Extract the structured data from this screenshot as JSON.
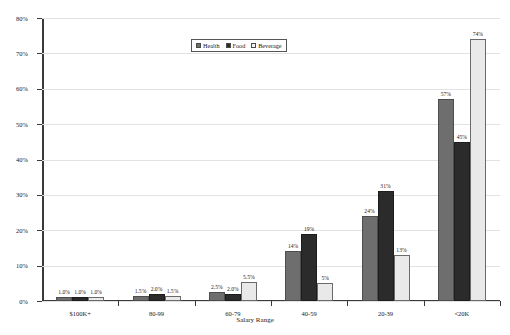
{
  "chart_data": {
    "type": "bar",
    "title": "",
    "xlabel": "Salary Range",
    "ylabel": "",
    "categories": [
      "$100K+",
      "80-99",
      "60-79",
      "40-59",
      "20-39",
      "<20K"
    ],
    "ylim": [
      0,
      80
    ],
    "ytick_values": [
      0,
      10,
      20,
      30,
      40,
      50,
      60,
      70,
      80
    ],
    "ytick_labels": [
      "0%",
      "10%",
      "20%",
      "30%",
      "40%",
      "50%",
      "60%",
      "70%",
      "80%"
    ],
    "grid": true,
    "legend_position": "top-center",
    "series": [
      {
        "name": "Health",
        "color": "#6e6e6e",
        "values": [
          1.0,
          1.5,
          2.5,
          14,
          24,
          57
        ],
        "labels": [
          "1.0%",
          "1.5%",
          "2.5%",
          "14%",
          "24%",
          "57%"
        ]
      },
      {
        "name": "Food",
        "color": "#2b2b2b",
        "values": [
          1.0,
          2.0,
          2.0,
          19,
          31,
          45
        ],
        "labels": [
          "1.0%",
          "2.0%",
          "2.0%",
          "19%",
          "31%",
          "45%"
        ]
      },
      {
        "name": "Beverage",
        "color": "#e9e9e9",
        "values": [
          1.0,
          1.5,
          5.5,
          5,
          13,
          74
        ],
        "labels": [
          "1.0%",
          "1.5%",
          "5.5%",
          "5%",
          "13%",
          "74%"
        ]
      }
    ]
  }
}
